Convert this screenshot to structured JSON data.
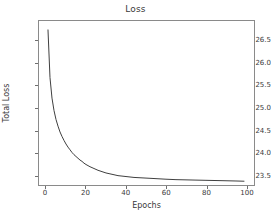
{
  "figure": {
    "background_color": "#ffffff",
    "axes_color": "#8a8a8a",
    "text_color": "#3a3a3a"
  },
  "chart_data": {
    "type": "line",
    "title": "Loss",
    "xlabel": "Epochs",
    "ylabel": "Total Loss",
    "grid": false,
    "legend": null,
    "line_color": "#3f3f3f",
    "line_width": 1,
    "xlim": [
      -3.5,
      104
    ],
    "ylim": [
      23.27,
      26.95
    ],
    "xticks": [
      0,
      20,
      40,
      60,
      80,
      100
    ],
    "xtick_labels": [
      "0",
      "20",
      "40",
      "60",
      "80",
      "100"
    ],
    "yticks": [
      23.5,
      24.0,
      24.5,
      25.0,
      25.5,
      26.0,
      26.5
    ],
    "ytick_labels": [
      "23.5",
      "24.0",
      "24.5",
      "25.0",
      "25.5",
      "26.0",
      "26.5"
    ],
    "series": [
      {
        "name": "Total Loss",
        "x": [
          1,
          2,
          3,
          4,
          5,
          6,
          7,
          8,
          9,
          10,
          11,
          12,
          13,
          14,
          15,
          16,
          17,
          18,
          19,
          20,
          22,
          24,
          26,
          28,
          30,
          32,
          34,
          36,
          38,
          40,
          44,
          48,
          52,
          56,
          60,
          65,
          70,
          75,
          80,
          85,
          90,
          95,
          99
        ],
        "values": [
          26.75,
          25.68,
          25.22,
          24.94,
          24.74,
          24.59,
          24.46,
          24.36,
          24.27,
          24.19,
          24.12,
          24.06,
          24.0,
          23.95,
          23.91,
          23.87,
          23.83,
          23.8,
          23.76,
          23.73,
          23.68,
          23.64,
          23.6,
          23.57,
          23.54,
          23.52,
          23.5,
          23.48,
          23.47,
          23.46,
          23.44,
          23.43,
          23.42,
          23.41,
          23.4,
          23.39,
          23.385,
          23.38,
          23.375,
          23.37,
          23.365,
          23.36,
          23.355
        ]
      }
    ]
  }
}
